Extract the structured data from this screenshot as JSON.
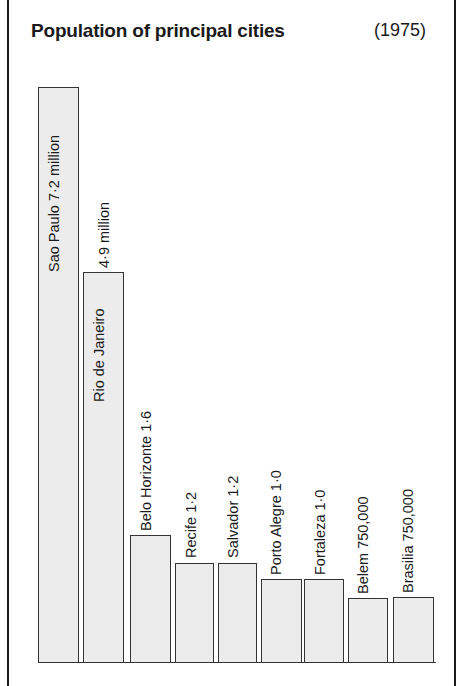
{
  "header": {
    "title": "Population of principal cities",
    "year": "(1975)"
  },
  "bars": [
    {
      "label": "Sao Paulo  7·2 million",
      "left": 38,
      "top": 87,
      "width": 41,
      "height": 576,
      "label_x": 46,
      "label_y": 272,
      "inside": true
    },
    {
      "label": "Rio de Janeiro",
      "left": 83,
      "top": 272,
      "width": 41,
      "height": 391,
      "label_x": 91,
      "label_y": 402,
      "inside": true
    },
    {
      "label": "4·9 million",
      "left": 0,
      "top": 0,
      "width": 0,
      "height": 0,
      "label_x": 96,
      "label_y": 268,
      "inside": false
    },
    {
      "label": "Belo Horizonte 1·6",
      "left": 130,
      "top": 535,
      "width": 41,
      "height": 128,
      "label_x": 138,
      "label_y": 531,
      "inside": false
    },
    {
      "label": "Recife 1·2",
      "left": 175,
      "top": 563,
      "width": 39,
      "height": 100,
      "label_x": 183,
      "label_y": 558,
      "inside": false
    },
    {
      "label": "Salvador 1·2",
      "left": 218,
      "top": 563,
      "width": 39,
      "height": 100,
      "label_x": 225,
      "label_y": 558,
      "inside": false
    },
    {
      "label": "Porto Alegre 1·0",
      "left": 261,
      "top": 579,
      "width": 41,
      "height": 84,
      "label_x": 268,
      "label_y": 575,
      "inside": false
    },
    {
      "label": "Fortaleza 1·0",
      "left": 304,
      "top": 579,
      "width": 40,
      "height": 84,
      "label_x": 312,
      "label_y": 575,
      "inside": false
    },
    {
      "label": "Belem  750,000",
      "left": 348,
      "top": 598,
      "width": 40,
      "height": 65,
      "label_x": 355,
      "label_y": 594,
      "inside": false
    },
    {
      "label": "Brasilia 750,000",
      "left": 393,
      "top": 597,
      "width": 41,
      "height": 66,
      "label_x": 400,
      "label_y": 593,
      "inside": false
    }
  ],
  "chart_data": {
    "type": "bar",
    "title": "Population of principal cities",
    "subtitle": "(1975)",
    "categories": [
      "Sao Paulo",
      "Rio de Janeiro",
      "Belo Horizonte",
      "Recife",
      "Salvador",
      "Porto Alegre",
      "Fortaleza",
      "Belem",
      "Brasilia"
    ],
    "values": [
      7.2,
      4.9,
      1.6,
      1.2,
      1.2,
      1.0,
      1.0,
      0.75,
      0.75
    ],
    "value_labels": [
      "7·2 million",
      "4·9 million",
      "1·6",
      "1·2",
      "1·2",
      "1·0",
      "1·0",
      "750,000",
      "750,000"
    ],
    "xlabel": "",
    "ylabel": "Population (millions)",
    "ylim": [
      0,
      7.2
    ],
    "grid": false,
    "legend": null,
    "orientation": "vertical bars, rotated labels"
  }
}
